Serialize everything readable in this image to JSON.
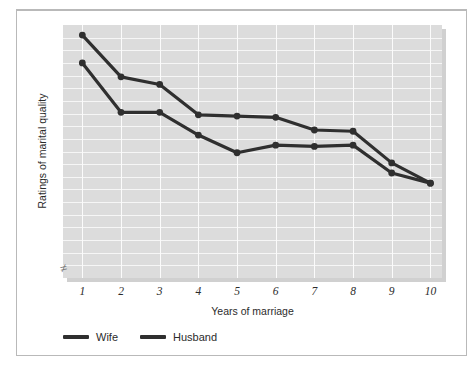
{
  "chart_data": {
    "type": "line",
    "title": "",
    "xlabel": "Years of marriage",
    "ylabel": "Ratings of marital quality",
    "x": [
      1,
      2,
      3,
      4,
      5,
      6,
      7,
      8,
      9,
      10
    ],
    "xtick_labels": [
      "1",
      "2",
      "3",
      "4",
      "5",
      "6",
      "7",
      "8",
      "9",
      "10"
    ],
    "ytick_labels": [],
    "xlim": [
      0.5,
      10.3
    ],
    "ylim": [
      0,
      20
    ],
    "grid": "both-axes-white-gridlines-on-gray-panel",
    "legend_position": "below-plot-left",
    "axis_break": "y-axis break symbol at lower-left of plot",
    "series": [
      {
        "name": "Wife",
        "color": "#2f2f2f",
        "marker": "filled-circle",
        "values": [
          19.2,
          15.9,
          15.3,
          12.9,
          12.8,
          12.7,
          11.7,
          11.6,
          9.1,
          7.5
        ]
      },
      {
        "name": "Husband",
        "color": "#2f2f2f",
        "marker": "filled-circle",
        "values": [
          17.0,
          13.1,
          13.1,
          11.3,
          9.9,
          10.5,
          10.4,
          10.5,
          8.3,
          7.5
        ]
      }
    ]
  },
  "axes": {
    "x_title": "Years of marriage",
    "y_title": "Ratings of marital quality",
    "break_glyph": "≠"
  },
  "legend": {
    "items": [
      {
        "label": "Wife"
      },
      {
        "label": "Husband"
      }
    ]
  },
  "style": {
    "panel_color": "#dcdcdc",
    "gridline_color": "#f6f6f6",
    "line_color": "#2f2f2f",
    "frame_color": "#b9b9b9",
    "text_color": "#2b2b2b"
  }
}
